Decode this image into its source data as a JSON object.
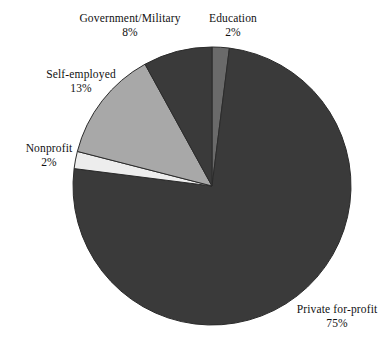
{
  "chart_data": {
    "type": "pie",
    "title": "",
    "subtitle": "",
    "xlabel": "",
    "ylabel": "",
    "grid": false,
    "legend_position": "none",
    "labels_outside": true,
    "start_angle_deg": 0,
    "direction": "clockwise",
    "categories": [
      "Education",
      "Private for-profit",
      "Nonprofit",
      "Self-employed",
      "Government/Military"
    ],
    "values": [
      2,
      75,
      2,
      13,
      8
    ],
    "unit": "%",
    "slices": [
      {
        "name": "Education",
        "value": 2,
        "value_text": "2%",
        "color": "#6a6a6a",
        "start_deg": 0,
        "end_deg": 7.2
      },
      {
        "name": "Private for-profit",
        "value": 75,
        "value_text": "75%",
        "color": "#3a3a3a",
        "start_deg": 7.2,
        "end_deg": 277.2
      },
      {
        "name": "Nonprofit",
        "value": 2,
        "value_text": "2%",
        "color": "#ededed",
        "start_deg": 277.2,
        "end_deg": 284.4
      },
      {
        "name": "Self-employed",
        "value": 13,
        "value_text": "13%",
        "color": "#a8a8a8",
        "start_deg": 284.4,
        "end_deg": 331.2
      },
      {
        "name": "Government/Military",
        "value": 8,
        "value_text": "8%",
        "color": "#3a3a3a",
        "start_deg": 331.2,
        "end_deg": 360
      }
    ]
  },
  "labels": {
    "government": {
      "name": "Government/Military",
      "pct": "8%"
    },
    "education": {
      "name": "Education",
      "pct": "2%"
    },
    "self_employed": {
      "name": "Self-employed",
      "pct": "13%"
    },
    "nonprofit": {
      "name": "Nonprofit",
      "pct": "2%"
    },
    "private": {
      "name": "Private for-profit",
      "pct": "75%"
    }
  },
  "geometry": {
    "center_x": 212,
    "center_y": 186,
    "radius": 139
  },
  "colors": {
    "background": "#ffffff",
    "text": "#111111",
    "dark_slice": "#3a3a3a",
    "medium_slice": "#6a6a6a",
    "light_slice": "#a8a8a8",
    "pale_slice": "#ededed",
    "slice_outline": "#2b2b2b"
  }
}
